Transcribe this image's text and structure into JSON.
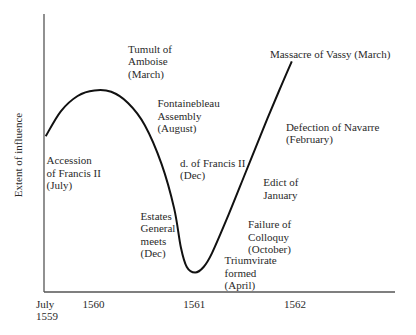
{
  "chart_data": {
    "type": "line",
    "title": "",
    "xlabel": "",
    "ylabel": "Extent of influence",
    "grid": false,
    "legend": "none",
    "x_unit": "months since July 1559",
    "xlim": [
      0,
      41
    ],
    "ylim": [
      0,
      100
    ],
    "x_ticks": [
      {
        "x": 0,
        "label": [
          "July",
          "1559"
        ]
      },
      {
        "x": 6,
        "label": [
          "1560"
        ]
      },
      {
        "x": 18,
        "label": [
          "1561"
        ]
      },
      {
        "x": 30,
        "label": [
          "1562"
        ]
      }
    ],
    "series": [
      {
        "name": "Extent of influence",
        "points": [
          [
            0.2,
            56
          ],
          [
            2,
            65
          ],
          [
            4,
            70.5
          ],
          [
            6,
            72.5
          ],
          [
            8,
            72
          ],
          [
            10,
            68
          ],
          [
            12,
            60
          ],
          [
            14,
            46
          ],
          [
            15.5,
            30
          ],
          [
            16.3,
            16
          ],
          [
            17,
            9
          ],
          [
            18,
            7
          ],
          [
            19,
            9
          ],
          [
            20,
            14
          ],
          [
            22,
            28
          ],
          [
            24,
            43
          ],
          [
            26,
            58
          ],
          [
            28,
            72.5
          ],
          [
            29.5,
            83
          ]
        ]
      }
    ],
    "annotations": [
      {
        "id": "accession",
        "lines": [
          "Accession",
          "of Francis II",
          "(July)"
        ],
        "x": 0.3,
        "y": 46
      },
      {
        "id": "tumult",
        "lines": [
          "Tumult of",
          "Amboise",
          "(March)"
        ],
        "x": 10,
        "y": 86
      },
      {
        "id": "fontainebleau",
        "lines": [
          "Fontainebleau",
          "Assembly",
          "(August)"
        ],
        "x": 13.5,
        "y": 66.5
      },
      {
        "id": "death-francis",
        "lines": [
          "d. of Francis II",
          "(Dec)"
        ],
        "x": 16.2,
        "y": 45
      },
      {
        "id": "estates",
        "lines": [
          "Estates",
          "General",
          "meets",
          "(Dec)"
        ],
        "x": 11.5,
        "y": 26
      },
      {
        "id": "triumvirate",
        "lines": [
          "Triumvirate",
          "formed",
          "(April)"
        ],
        "x": 21.5,
        "y": 10
      },
      {
        "id": "colloquy",
        "lines": [
          "Failure of",
          "Colloquy",
          "(October)"
        ],
        "x": 24.3,
        "y": 23
      },
      {
        "id": "edict",
        "lines": [
          "Edict of",
          "January"
        ],
        "x": 26.1,
        "y": 38
      },
      {
        "id": "navarre",
        "lines": [
          "Defection of Navarre",
          "(February)"
        ],
        "x": 28.8,
        "y": 58
      },
      {
        "id": "vassy",
        "lines": [
          "Massacre of Vassy (March)"
        ],
        "x": 26.9,
        "y": 84
      }
    ]
  }
}
